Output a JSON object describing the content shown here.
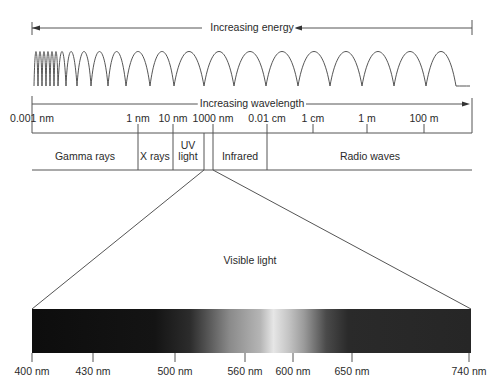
{
  "energy_axis": {
    "label": "Increasing energy",
    "direction": "left"
  },
  "wavelength_axis": {
    "label": "Increasing wavelength",
    "direction": "right",
    "ticks": [
      {
        "label": "0.001 nm",
        "x": 32
      },
      {
        "label": "1 nm",
        "x": 138
      },
      {
        "label": "10 nm",
        "x": 173
      },
      {
        "label": "1000 nm",
        "x": 213
      },
      {
        "label": "0.01 cm",
        "x": 267
      },
      {
        "label": "1 cm",
        "x": 313
      },
      {
        "label": "1 m",
        "x": 367
      },
      {
        "label": "100 m",
        "x": 424
      }
    ]
  },
  "bands": [
    {
      "label": "Gamma rays",
      "x": 85
    },
    {
      "label": "X rays",
      "x": 155
    },
    {
      "label": "UV light",
      "line1": "UV",
      "line2": "light",
      "x": 188
    },
    {
      "label": "Infrared",
      "x": 240
    },
    {
      "label": "Radio waves",
      "x": 370
    }
  ],
  "visible": {
    "label": "Visible light",
    "ticks": [
      {
        "label": "400 nm",
        "x": 32
      },
      {
        "label": "430 nm",
        "x": 93
      },
      {
        "label": "500 nm",
        "x": 175
      },
      {
        "label": "560 nm",
        "x": 245
      },
      {
        "label": "600 nm",
        "x": 293
      },
      {
        "label": "650 nm",
        "x": 352
      },
      {
        "label": "740 nm",
        "x": 469
      }
    ]
  },
  "colors": {
    "line": "#555555",
    "text": "#2a2a2a",
    "spectrum_dark": "#111111",
    "spectrum_peak": "#e8e8e8"
  }
}
